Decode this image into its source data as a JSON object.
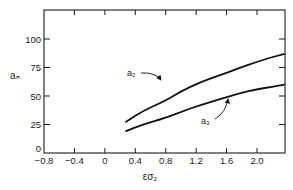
{
  "chart_data": {
    "type": "line",
    "title": "",
    "xlabel": "εσ₂",
    "ylabel": "aₙ",
    "xlim": [
      -0.8,
      2.37
    ],
    "ylim": [
      0,
      120
    ],
    "xticks": [
      -0.8,
      -0.4,
      0,
      0.4,
      0.8,
      1.2,
      1.6,
      2.0
    ],
    "xtick_labels": [
      "−0.8",
      "−0.4",
      "0",
      "0.4",
      "0.8",
      "1.2",
      "1.6",
      "2.0"
    ],
    "yticks": [
      0,
      25,
      50,
      75,
      100
    ],
    "ytick_labels": [
      "0",
      "25",
      "50",
      "75",
      "100"
    ],
    "grid": false,
    "legend": "inline annotations with arrows",
    "series": [
      {
        "name": "a₂",
        "x": [
          0.27,
          0.5,
          0.8,
          1.0,
          1.25,
          1.5,
          1.75,
          2.0,
          2.2,
          2.37
        ],
        "y": [
          27,
          37,
          46,
          54,
          62,
          68,
          74,
          80,
          84,
          87
        ]
      },
      {
        "name": "a₃",
        "x": [
          0.27,
          0.5,
          0.8,
          1.0,
          1.25,
          1.5,
          1.75,
          2.0,
          2.2,
          2.37
        ],
        "y": [
          19,
          25,
          31,
          36,
          42,
          47,
          52,
          56,
          58,
          60
        ]
      }
    ]
  }
}
